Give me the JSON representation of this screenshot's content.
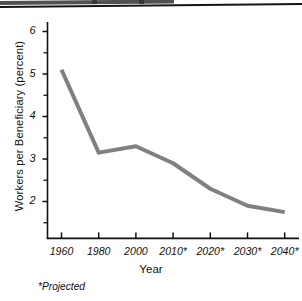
{
  "page": {
    "background": "#ffffff",
    "ink": "#111111"
  },
  "chart_data": {
    "type": "line",
    "title": "",
    "xlabel": "Year",
    "ylabel": "Workers per Beneficiary (percent)",
    "categories": [
      "1960",
      "1980",
      "2000",
      "2010*",
      "2020*",
      "2030*",
      "2040*"
    ],
    "x": [
      1960,
      1980,
      2000,
      2010,
      2020,
      2030,
      2040
    ],
    "values": [
      5.1,
      3.15,
      3.3,
      2.9,
      2.3,
      1.9,
      1.75
    ],
    "series": [
      {
        "name": "Workers per Beneficiary",
        "color": "#808080",
        "values": [
          5.1,
          3.15,
          3.3,
          2.9,
          2.3,
          1.9,
          1.75
        ]
      }
    ],
    "ylim": [
      1.35,
      6.25
    ],
    "yticks": [
      2,
      3,
      4,
      5,
      6
    ],
    "ytick_labels": [
      "2",
      "3",
      "4",
      "5",
      "6"
    ],
    "yminor_ticks": [
      1.5,
      2.5,
      3.5,
      4.5,
      5.5
    ],
    "grid": false,
    "legend": "none",
    "line_width": 4,
    "footnote": "*Projected"
  }
}
